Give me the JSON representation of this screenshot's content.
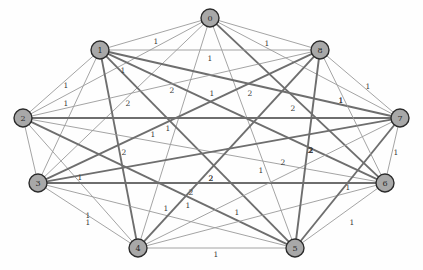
{
  "chart_data": {
    "type": "diagram",
    "title": "",
    "subtitle": "",
    "xlabel": "",
    "ylabel": "",
    "graph_kind": "undirected weighted graph",
    "layout": "circular",
    "grid": false,
    "legend": "none",
    "background_color": "#ffffff",
    "node_fill_color": "#a8a8a8",
    "node_stroke_color": "#2b2b2b",
    "edge_weight1_color": "#9a9a9a",
    "edge_weight2_color": "#6e6e6e",
    "node_count": 9,
    "edge_count": 33,
    "nodes": [
      {
        "id": "0",
        "label": "0",
        "x": 210,
        "y": 18
      },
      {
        "id": "1",
        "label": "1",
        "x": 100,
        "y": 50
      },
      {
        "id": "2",
        "label": "2",
        "x": 23,
        "y": 118
      },
      {
        "id": "3",
        "label": "3",
        "x": 38,
        "y": 183
      },
      {
        "id": "4",
        "label": "4",
        "x": 138,
        "y": 248
      },
      {
        "id": "5",
        "label": "5",
        "x": 295,
        "y": 248
      },
      {
        "id": "6",
        "label": "6",
        "x": 385,
        "y": 183
      },
      {
        "id": "7",
        "label": "7",
        "x": 400,
        "y": 118
      },
      {
        "id": "8",
        "label": "8",
        "x": 320,
        "y": 50
      }
    ],
    "edges": [
      {
        "source": "0",
        "target": "1",
        "weight": 1,
        "label": "1",
        "lx": 156,
        "ly": 41
      },
      {
        "source": "0",
        "target": "8",
        "weight": 1,
        "label": "1",
        "lx": 267,
        "ly": 43
      },
      {
        "source": "0",
        "target": "2",
        "weight": 1,
        "label": "1",
        "lx": 123,
        "ly": 70
      },
      {
        "source": "0",
        "target": "3",
        "weight": 1,
        "label": "1",
        "lx": 153,
        "ly": 134
      },
      {
        "source": "0",
        "target": "4",
        "weight": 1,
        "label": "1",
        "lx": 188,
        "ly": 205
      },
      {
        "source": "0",
        "target": "5",
        "weight": 1,
        "label": "1",
        "lx": 261,
        "ly": 170
      },
      {
        "source": "0",
        "target": "6",
        "weight": 2,
        "label": "2",
        "lx": 293,
        "ly": 108
      },
      {
        "source": "0",
        "target": "7",
        "weight": 1,
        "label": "1",
        "lx": 341,
        "ly": 100
      },
      {
        "source": "1",
        "target": "8",
        "weight": 1,
        "label": "1",
        "lx": 210,
        "ly": 58
      },
      {
        "source": "1",
        "target": "2",
        "weight": 1,
        "label": "1",
        "lx": 66,
        "ly": 85
      },
      {
        "source": "1",
        "target": "3",
        "weight": 1,
        "label": "1",
        "lx": 66,
        "ly": 103
      },
      {
        "source": "1",
        "target": "4",
        "weight": 2,
        "label": "2",
        "lx": 124,
        "ly": 152
      },
      {
        "source": "1",
        "target": "5",
        "weight": 2,
        "label": "2",
        "lx": 211,
        "ly": 178
      },
      {
        "source": "1",
        "target": "6",
        "weight": 2,
        "label": "2",
        "lx": 250,
        "ly": 93
      },
      {
        "source": "1",
        "target": "7",
        "weight": 2,
        "label": "2",
        "lx": 172,
        "ly": 90
      },
      {
        "source": "2",
        "target": "3",
        "weight": 1,
        "label": "1",
        "lx": 80,
        "ly": 177
      },
      {
        "source": "2",
        "target": "4",
        "weight": 1,
        "label": "1",
        "lx": 88,
        "ly": 215
      },
      {
        "source": "2",
        "target": "5",
        "weight": 2,
        "label": "2",
        "lx": 191,
        "ly": 192
      },
      {
        "source": "2",
        "target": "6",
        "weight": 1,
        "label": "1",
        "lx": 212,
        "ly": 93
      },
      {
        "source": "2",
        "target": "7",
        "weight": 2,
        "label": "2",
        "lx": 128,
        "ly": 103
      },
      {
        "source": "2",
        "target": "8",
        "weight": 1,
        "label": "1",
        "lx": 168,
        "ly": 128
      },
      {
        "source": "3",
        "target": "4",
        "weight": 1,
        "label": "1",
        "lx": 88,
        "ly": 222
      },
      {
        "source": "3",
        "target": "5",
        "weight": 1,
        "label": "1",
        "lx": 166,
        "ly": 208
      },
      {
        "source": "3",
        "target": "6",
        "weight": 2,
        "label": "2",
        "lx": 211,
        "ly": 178
      },
      {
        "source": "3",
        "target": "7",
        "weight": 2,
        "label": "2",
        "lx": 283,
        "ly": 162
      },
      {
        "source": "3",
        "target": "8",
        "weight": 2,
        "label": "2",
        "lx": 311,
        "ly": 150
      },
      {
        "source": "4",
        "target": "5",
        "weight": 1,
        "label": "1",
        "lx": 216,
        "ly": 254
      },
      {
        "source": "4",
        "target": "6",
        "weight": 1,
        "label": "1",
        "lx": 237,
        "ly": 212
      },
      {
        "source": "4",
        "target": "7",
        "weight": 1,
        "label": "1",
        "lx": 348,
        "ly": 187
      },
      {
        "source": "4",
        "target": "8",
        "weight": 2,
        "label": "2",
        "lx": 310,
        "ly": 150
      },
      {
        "source": "5",
        "target": "6",
        "weight": 1,
        "label": "1",
        "lx": 352,
        "ly": 222
      },
      {
        "source": "5",
        "target": "7",
        "weight": 2,
        "label": "2",
        "lx": 311,
        "ly": 150
      },
      {
        "source": "5",
        "target": "8",
        "weight": 2,
        "label": "2",
        "lx": 311,
        "ly": 150
      },
      {
        "source": "6",
        "target": "7",
        "weight": 1,
        "label": "1",
        "lx": 396,
        "ly": 152
      },
      {
        "source": "6",
        "target": "8",
        "weight": 1,
        "label": "1",
        "lx": 341,
        "ly": 100
      },
      {
        "source": "7",
        "target": "8",
        "weight": 1,
        "label": "1",
        "lx": 368,
        "ly": 86
      }
    ],
    "node_radius": 9
  },
  "figure": {
    "caption": ""
  }
}
